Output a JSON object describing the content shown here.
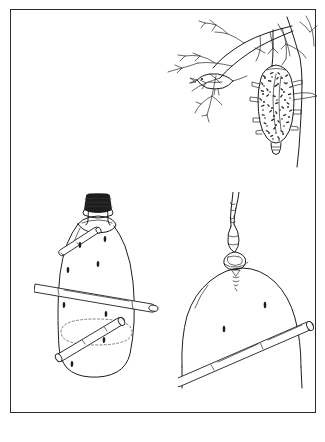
{
  "plate": {
    "medium": "black-and-white pen-and-ink line drawing",
    "background_color": "#ffffff",
    "ink_color": "#1d1d1d",
    "border_color": "#2b2b2b",
    "panel_count": 3,
    "visible_text": ""
  },
  "figures": [
    {
      "id": "bagworm-on-branch",
      "name": "bagworm case hanging from tree branch",
      "position": "upper right",
      "elements": [
        "tree trunk",
        "forking branch",
        "small perched bird",
        "silk hanging thread",
        "bagworm case covered in twig fragments"
      ]
    },
    {
      "id": "bottle-feeder",
      "name": "plastic bottle bird feeder with dowel perches",
      "position": "lower left",
      "elements": [
        "screw cap",
        "bottle neck",
        "bottle body",
        "upper dowel perch",
        "lower dowel perch",
        "dashed seed-level ellipse",
        "feeding holes"
      ]
    },
    {
      "id": "feeder-bottom-detail",
      "name": "detail of hanging feeder bottom with wire hanger",
      "position": "lower right",
      "elements": [
        "twisted wire hanger",
        "wire loop",
        "screw eye",
        "dome shaped feeder base",
        "dowel perch",
        "feeding holes"
      ]
    }
  ],
  "labels": {
    "none": ""
  }
}
